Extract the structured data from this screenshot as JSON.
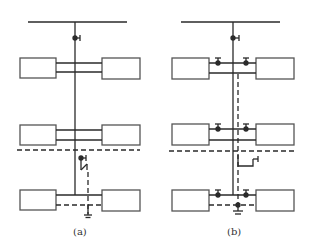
{
  "diagram": {
    "type": "electrical-single-line-comparison",
    "panels": [
      {
        "id": "a",
        "label": "(a)"
      },
      {
        "id": "b",
        "label": "(b)"
      }
    ],
    "colors": {
      "line": "#2a2a2a",
      "box_stroke": "#555555",
      "background": "#ffffff"
    }
  }
}
